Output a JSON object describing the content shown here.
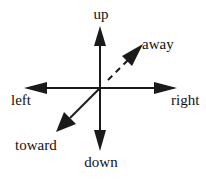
{
  "diagram": {
    "type": "direction-axes",
    "colors": {
      "stroke": "#1a1a1a",
      "text": "#111111",
      "background": "#ffffff"
    },
    "center": {
      "x": 100,
      "y": 88
    },
    "arrows": [
      {
        "id": "up",
        "label": "up",
        "style": "solid"
      },
      {
        "id": "down",
        "label": "down",
        "style": "solid"
      },
      {
        "id": "left",
        "label": "left",
        "style": "solid"
      },
      {
        "id": "right",
        "label": "right",
        "style": "solid"
      },
      {
        "id": "toward",
        "label": "toward",
        "style": "solid"
      },
      {
        "id": "away",
        "label": "away",
        "style": "dashed"
      }
    ]
  }
}
